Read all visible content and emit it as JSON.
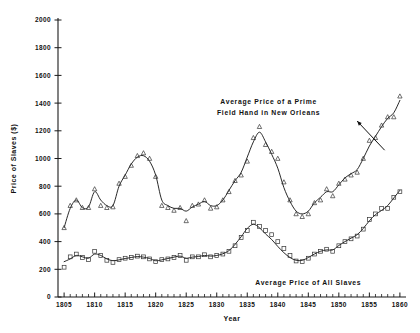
{
  "chart_data": {
    "type": "scatter",
    "title": "",
    "xlabel": "Year",
    "ylabel": "Price of Slaves ($)",
    "xlim": [
      1804,
      1861
    ],
    "ylim": [
      0,
      2000
    ],
    "grid": false,
    "legend_position": "inline-annotations",
    "x_ticks": [
      1805,
      1810,
      1815,
      1820,
      1825,
      1830,
      1835,
      1840,
      1845,
      1850,
      1855,
      1860
    ],
    "x_tick_labels": [
      "1805",
      "1810",
      "1815",
      "1820",
      "1825",
      "1830",
      "1835",
      "1840",
      "1845",
      "1850",
      "1855",
      "1860"
    ],
    "x_minor_tick_step": 1,
    "y_ticks": [
      0,
      200,
      400,
      600,
      800,
      1000,
      1200,
      1400,
      1600,
      1800,
      2000
    ],
    "y_tick_labels": [
      "0",
      "200",
      "400",
      "600",
      "800",
      "1000",
      "1200",
      "1400",
      "1600",
      "1800",
      "2000"
    ],
    "annotations": [
      {
        "id": "prime-field-hand-annotation",
        "lines": [
          "Average Price of a Prime",
          "Field Hand in New Orleans"
        ],
        "x": 1838.5,
        "y": 1390,
        "leader": {
          "from_x": 1853.0,
          "from_y": 1270,
          "to_x": 1857.5,
          "to_y": 1060
        }
      },
      {
        "id": "all-slaves-annotation",
        "lines": [
          "Average Price of All Slaves"
        ],
        "x": 1845.0,
        "y": 90,
        "leader": null
      }
    ],
    "series": [
      {
        "name": "Average Price of a Prime Field Hand in New Orleans",
        "marker": "triangle",
        "x": [
          1805,
          1806,
          1807,
          1808,
          1809,
          1810,
          1811,
          1812,
          1813,
          1814,
          1815,
          1816,
          1817,
          1818,
          1819,
          1820,
          1821,
          1822,
          1823,
          1824,
          1825,
          1826,
          1827,
          1828,
          1829,
          1830,
          1831,
          1832,
          1833,
          1834,
          1835,
          1836,
          1837,
          1838,
          1839,
          1840,
          1841,
          1842,
          1843,
          1844,
          1845,
          1846,
          1847,
          1848,
          1849,
          1850,
          1851,
          1852,
          1853,
          1854,
          1855,
          1856,
          1857,
          1858,
          1859,
          1860
        ],
        "scatter_y": [
          500,
          660,
          700,
          645,
          645,
          780,
          660,
          645,
          650,
          820,
          870,
          950,
          1020,
          1040,
          1000,
          870,
          660,
          645,
          625,
          645,
          550,
          660,
          670,
          700,
          640,
          650,
          700,
          760,
          840,
          880,
          980,
          1150,
          1230,
          1100,
          1050,
          1000,
          830,
          700,
          600,
          580,
          600,
          680,
          700,
          780,
          730,
          820,
          850,
          880,
          900,
          1000,
          1130,
          1150,
          1240,
          1300,
          1300,
          1450
        ],
        "line_y": [
          500,
          640,
          700,
          645,
          650,
          760,
          700,
          660,
          660,
          800,
          880,
          960,
          1010,
          1020,
          980,
          880,
          700,
          660,
          640,
          640,
          620,
          650,
          670,
          690,
          660,
          660,
          700,
          770,
          840,
          900,
          1010,
          1120,
          1190,
          1120,
          1030,
          930,
          790,
          690,
          620,
          600,
          620,
          680,
          720,
          760,
          760,
          810,
          860,
          890,
          920,
          1000,
          1090,
          1160,
          1230,
          1290,
          1330,
          1420
        ]
      },
      {
        "name": "Average Price of All Slaves",
        "marker": "square",
        "x": [
          1805,
          1806,
          1807,
          1808,
          1809,
          1810,
          1811,
          1812,
          1813,
          1814,
          1815,
          1816,
          1817,
          1818,
          1819,
          1820,
          1821,
          1822,
          1823,
          1824,
          1825,
          1826,
          1827,
          1828,
          1829,
          1830,
          1831,
          1832,
          1833,
          1834,
          1835,
          1836,
          1837,
          1838,
          1839,
          1840,
          1841,
          1842,
          1843,
          1844,
          1845,
          1846,
          1847,
          1848,
          1849,
          1850,
          1851,
          1852,
          1853,
          1854,
          1855,
          1856,
          1857,
          1858,
          1859,
          1860
        ],
        "scatter_y": [
          215,
          290,
          310,
          285,
          270,
          330,
          300,
          265,
          250,
          270,
          280,
          285,
          295,
          290,
          275,
          255,
          270,
          275,
          285,
          300,
          265,
          290,
          290,
          305,
          290,
          300,
          310,
          330,
          370,
          430,
          480,
          540,
          510,
          480,
          450,
          400,
          350,
          300,
          260,
          255,
          280,
          310,
          330,
          345,
          330,
          370,
          400,
          420,
          440,
          490,
          560,
          600,
          640,
          640,
          720,
          760
        ],
        "line_y": [
          255,
          275,
          300,
          290,
          280,
          310,
          300,
          275,
          262,
          268,
          278,
          285,
          292,
          288,
          278,
          262,
          268,
          278,
          288,
          295,
          280,
          288,
          292,
          300,
          295,
          300,
          312,
          335,
          380,
          435,
          495,
          525,
          500,
          455,
          415,
          365,
          320,
          285,
          265,
          265,
          285,
          310,
          330,
          340,
          340,
          372,
          400,
          425,
          450,
          495,
          550,
          595,
          625,
          660,
          715,
          770
        ]
      }
    ]
  },
  "axis": {
    "x_title": "Year",
    "y_title": "Price of Slaves ($)"
  }
}
